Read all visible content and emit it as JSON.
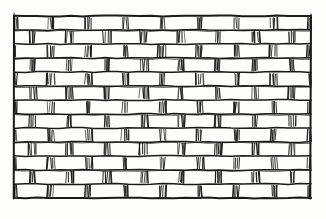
{
  "figure": {
    "style": "pen-and-ink line engraving",
    "background_color": "#fdfdfb",
    "ink_color": "#111111",
    "mortar_color": "#1a1a1a"
  },
  "wall": {
    "x": 14,
    "y": 16,
    "width": 297,
    "height": 182,
    "rows": 13,
    "row_height": 14.0,
    "brick_width": 37.1,
    "bond_pattern": "running-bond",
    "offset_fraction": 0.5,
    "border_stroke_width": 2.0,
    "course_stroke_width": 1.5,
    "head_joint_stroke_width": 1.0,
    "hatch_strokes_per_joint": 4,
    "hatch_jitter": 1.1,
    "courses": [
      {
        "index": 0,
        "offset": 0.0,
        "y_top": 16.0,
        "y_bottom": 30.0
      },
      {
        "index": 1,
        "offset": 0.5,
        "y_top": 30.0,
        "y_bottom": 44.0
      },
      {
        "index": 2,
        "offset": 0.0,
        "y_top": 44.0,
        "y_bottom": 58.0
      },
      {
        "index": 3,
        "offset": 0.5,
        "y_top": 58.0,
        "y_bottom": 72.0
      },
      {
        "index": 4,
        "offset": 0.0,
        "y_top": 72.0,
        "y_bottom": 86.0
      },
      {
        "index": 5,
        "offset": 0.5,
        "y_top": 86.0,
        "y_bottom": 100.0
      },
      {
        "index": 6,
        "offset": 0.0,
        "y_top": 100.0,
        "y_bottom": 114.0
      },
      {
        "index": 7,
        "offset": 0.5,
        "y_top": 114.0,
        "y_bottom": 128.0
      },
      {
        "index": 8,
        "offset": 0.0,
        "y_top": 128.0,
        "y_bottom": 142.0
      },
      {
        "index": 9,
        "offset": 0.5,
        "y_top": 142.0,
        "y_bottom": 156.0
      },
      {
        "index": 10,
        "offset": 0.0,
        "y_top": 156.0,
        "y_bottom": 170.0
      },
      {
        "index": 11,
        "offset": 0.5,
        "y_top": 170.0,
        "y_bottom": 184.0
      },
      {
        "index": 12,
        "offset": 0.0,
        "y_top": 184.0,
        "y_bottom": 198.0
      }
    ]
  },
  "caption": {
    "text": "",
    "visible": false
  }
}
